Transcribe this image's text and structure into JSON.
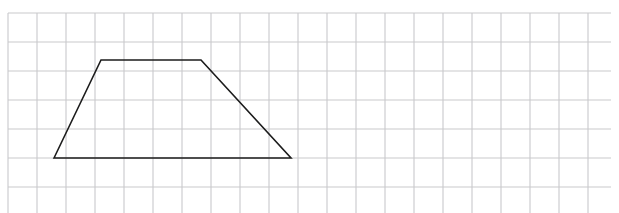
{
  "page": {
    "width": 619,
    "height": 213,
    "background_color": "#ffffff",
    "faint_header_text": ""
  },
  "grid": {
    "name": "square-grid",
    "origin_x": 8,
    "origin_y": 13,
    "cell_size": 29,
    "columns": 21,
    "rows": 7,
    "line_color": "#c9c9cc",
    "line_width": 1.1,
    "right_edge": 611,
    "bottom_edge": 216
  },
  "figure": {
    "name": "trapezoid",
    "type": "polygon",
    "sides": 4,
    "stroke_color": "#1c1c1c",
    "stroke_width": 1.6,
    "fill": "none",
    "vertices": [
      {
        "label": "bottom-left",
        "x": 54,
        "y": 158
      },
      {
        "label": "top-left",
        "x": 101,
        "y": 60
      },
      {
        "label": "top-right",
        "x": 201,
        "y": 60
      },
      {
        "label": "bottom-right",
        "x": 291,
        "y": 158
      }
    ],
    "vertices_in_cells": [
      {
        "label": "bottom-left",
        "col": 1.59,
        "row": 5.0
      },
      {
        "label": "top-left",
        "col": 3.21,
        "row": 1.62
      },
      {
        "label": "top-right",
        "col": 6.66,
        "row": 1.62
      },
      {
        "label": "bottom-right",
        "col": 9.76,
        "row": 5.0
      }
    ],
    "top_base_length_px": 100,
    "bottom_base_length_px": 237,
    "height_px": 98
  }
}
